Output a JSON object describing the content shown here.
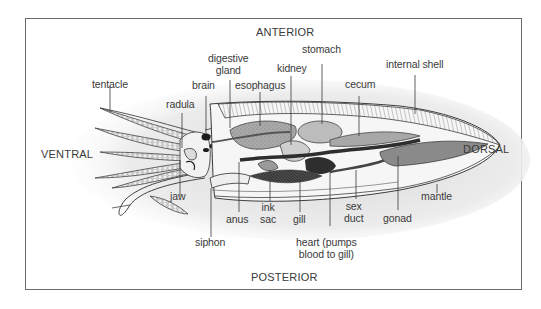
{
  "diagram": {
    "orientation": {
      "top": "ANTERIOR",
      "bottom": "POSTERIOR",
      "left": "VENTRAL",
      "right": "DORSAL"
    },
    "labels": {
      "tentacle": "tentacle",
      "radula": "radula",
      "brain": "brain",
      "digestive_gland_1": "digestive",
      "digestive_gland_2": "gland",
      "esophagus": "esophagus",
      "kidney": "kidney",
      "stomach": "stomach",
      "cecum": "cecum",
      "internal_shell": "internal shell",
      "jaw": "jaw",
      "siphon": "siphon",
      "anus": "anus",
      "ink_sac_1": "ink",
      "ink_sac_2": "sac",
      "gill": "gill",
      "heart_1": "heart (pumps",
      "heart_2": "blood to gill)",
      "sex_duct_1": "sex",
      "sex_duct_2": "duct",
      "gonad": "gonad",
      "mantle": "mantle"
    },
    "colors": {
      "frame": "#6a6a6a",
      "outline": "#3c3c3c",
      "organ_light": "#bdbdbd",
      "organ_mid": "#8f8f8f",
      "organ_dark": "#3a3a3a",
      "shading": "#e6e6e6"
    }
  }
}
